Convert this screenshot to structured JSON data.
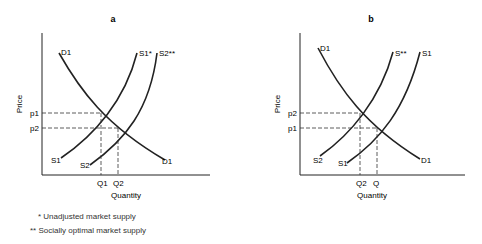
{
  "panels": [
    {
      "title": "a",
      "y_axis_label": "Price",
      "x_axis_label": "Quantity",
      "demand": {
        "label_top": "D1",
        "label_bottom": "D1"
      },
      "supply_1": {
        "label_top": "S1*",
        "label_bottom": "S1"
      },
      "supply_2": {
        "label_top": "S2**",
        "label_bottom": "S2"
      },
      "price_labels": [
        "p1",
        "p2"
      ],
      "quantity_labels": [
        "Q1",
        "Q2"
      ]
    },
    {
      "title": "b",
      "y_axis_label": "Price",
      "x_axis_label": "Quantity",
      "demand": {
        "label_top": "D1",
        "label_bottom": "D1"
      },
      "supply_1": {
        "label_top": "S1",
        "label_bottom": "S1"
      },
      "supply_2": {
        "label_top": "S**",
        "label_bottom": "S2"
      },
      "price_labels": [
        "p2",
        "p1"
      ],
      "quantity_labels": [
        "Q2",
        "Q"
      ]
    }
  ],
  "footnotes": [
    "* Unadjusted market supply",
    "** Socially optimal market supply"
  ]
}
